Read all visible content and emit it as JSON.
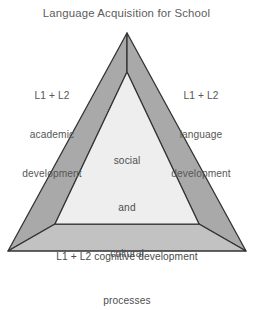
{
  "figure": {
    "title": "Language Acquisition for School",
    "background_color": "#ffffff",
    "text_color": "#555555",
    "band_color": "#a9a9a9",
    "base_band_color": "#c2c2c2",
    "inner_color": "#eeeeee",
    "outline_color": "#333333"
  },
  "labels": {
    "left": {
      "line1": "L1 + L2",
      "line2": "academic",
      "line3": "development"
    },
    "right": {
      "line1": "L1 + L2",
      "line2": "language",
      "line3": "development"
    },
    "center": {
      "line1": "social",
      "line2": "and",
      "line3": "cultural",
      "line4": "processes"
    },
    "bottom": {
      "line1": "L1 + L2 cognitive development"
    }
  },
  "geometry": {
    "outer_apex": "127,33",
    "outer_bottom_left": "8,251",
    "outer_bottom_right": "246,251",
    "inner_apex": "127,72",
    "inner_bottom_left": "55,224",
    "inner_bottom_right": "199,224"
  }
}
